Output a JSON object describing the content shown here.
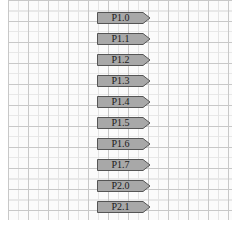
{
  "diagram": {
    "type": "schematic-net-labels",
    "grid": {
      "background": "#fbfbfb",
      "major_line": "#c8c8c8",
      "minor_line": "#e4e4e4"
    },
    "label_style": {
      "fill": "#a8a8a8",
      "stroke": "#555555",
      "shape": "arrow-right"
    },
    "net_labels": [
      {
        "text": "P1.0"
      },
      {
        "text": "P1.1"
      },
      {
        "text": "P1.2"
      },
      {
        "text": "P1.3"
      },
      {
        "text": "P1.4"
      },
      {
        "text": "P1.5"
      },
      {
        "text": "P1.6"
      },
      {
        "text": "P1.7"
      },
      {
        "text": "P2.0"
      },
      {
        "text": "P2.1"
      }
    ]
  }
}
